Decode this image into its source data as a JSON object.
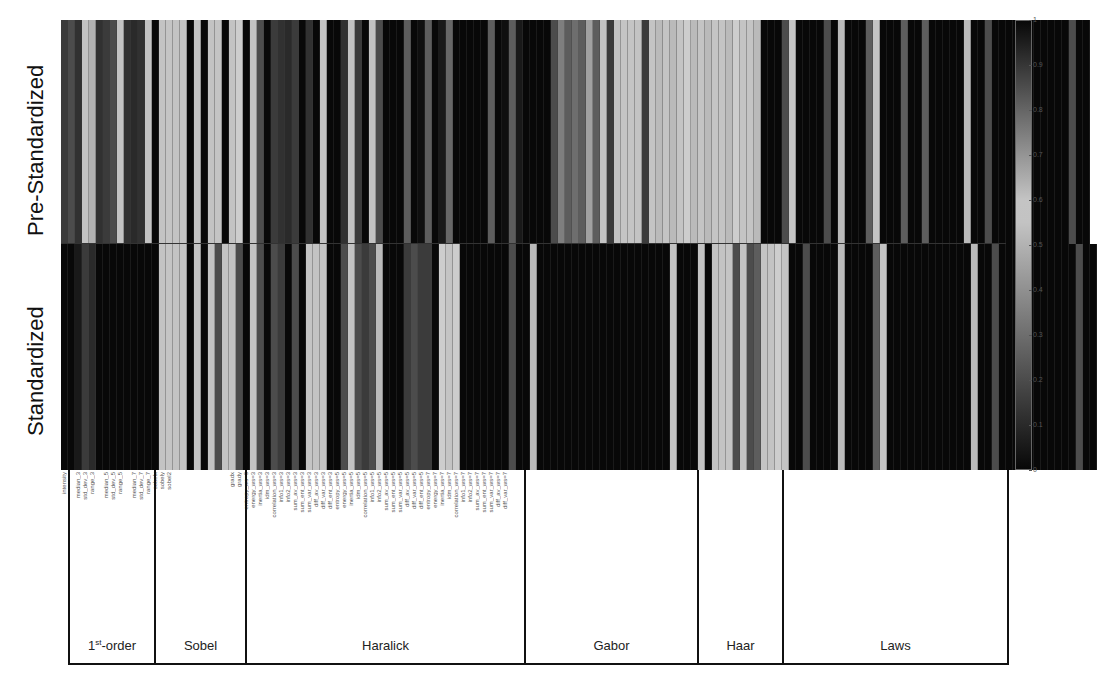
{
  "chart_data": {
    "type": "heatmap",
    "title": "",
    "ylabel_rows": [
      "Pre-Standardized",
      "Standardized"
    ],
    "colorbar": {
      "range": [
        0,
        1
      ],
      "ticks": [
        "1",
        "0.9",
        "0.8",
        "0.7",
        "0.6",
        "0.5",
        "0.4",
        "0.3",
        "0.2",
        "0.1",
        "0"
      ],
      "colormap": "gray, dark at 0 and 1, lightest around 0.55-0.6"
    },
    "groups": [
      {
        "name": "1st-order",
        "label_base": "1",
        "label_sup": "st",
        "label_rest": "-order",
        "start": 0,
        "count": 13
      },
      {
        "name": "Sobel",
        "label_base": "Sobel",
        "start": 13,
        "count": 13
      },
      {
        "name": "Haralick",
        "label_base": "Haralick",
        "start": 26,
        "count": 40
      },
      {
        "name": "Gabor",
        "label_base": "Gabor",
        "start": 66,
        "count": 25
      },
      {
        "name": "Haar",
        "label_base": "Haar",
        "start": 91,
        "count": 12
      },
      {
        "name": "Laws",
        "label_base": "Laws",
        "start": 103,
        "count": 32
      }
    ],
    "feature_labels": [
      "intensity",
      "",
      "median_3",
      "std_dev_3",
      "range_3",
      "",
      "median_5",
      "std_dev_5",
      "range_5",
      "",
      "median_7",
      "std_dev_7",
      "range_7",
      "sobelx",
      "sobely",
      "sobel2",
      "",
      "",
      "",
      "",
      "",
      "",
      "",
      "",
      "gradx",
      "grady",
      "entropy_ws=3",
      "energy_ws=3",
      "inertia_ws=3",
      "idm_ws=3",
      "correlation_ws=3",
      "info1_ws=3",
      "info2_ws=3",
      "sum_av_ws=3",
      "sum_ent_ws=3",
      "sum_var_ws=3",
      "diff_av_ws=3",
      "diff_var_ws=3",
      "diff_ent_ws=3",
      "entropy_ws=5",
      "energy_ws=5",
      "inertia_ws=5",
      "idm_ws=5",
      "correlation_ws=5",
      "info1_ws=5",
      "info2_ws=5",
      "sum_av_ws=5",
      "sum_ent_ws=5",
      "sum_var_ws=5",
      "diff_av_ws=5",
      "diff_var_ws=5",
      "diff_ent_ws=5",
      "entropy_ws=7",
      "energy_ws=7",
      "inertia_ws=7",
      "idm_ws=7",
      "correlation_ws=7",
      "info1_ws=7",
      "info2_ws=7",
      "sum_av_ws=7",
      "sum_ent_ws=7",
      "sum_var_ws=7",
      "diff_av_ws=7",
      "diff_var_ws=7",
      "",
      "",
      "",
      "",
      "",
      "",
      "",
      "",
      "",
      "",
      "",
      "",
      "",
      "",
      "",
      "",
      "",
      "",
      "",
      "",
      "",
      "",
      "",
      "",
      "",
      "",
      "",
      "",
      "",
      "",
      "",
      "",
      "",
      "",
      "",
      "",
      "",
      "",
      "",
      "",
      "",
      "",
      "",
      "",
      "",
      "",
      "",
      "",
      "",
      "",
      "",
      "",
      "",
      "",
      "",
      "",
      "",
      "",
      "",
      "",
      "",
      "",
      "",
      "",
      "",
      "",
      "",
      "",
      "",
      ""
    ],
    "rows": [
      {
        "name": "Pre-Standardized",
        "values": [
          0.15,
          0.2,
          0.12,
          0.55,
          0.5,
          0.12,
          0.15,
          0.2,
          0.55,
          0.12,
          0.1,
          0.12,
          0.55,
          0.0,
          0.55,
          0.6,
          0.55,
          0.6,
          0.0,
          0.55,
          0.0,
          0.55,
          0.6,
          0.0,
          0.55,
          0.58,
          0.0,
          0.55,
          0.2,
          0.0,
          0.15,
          0.12,
          0.1,
          0.15,
          0.0,
          0.12,
          0.0,
          0.55,
          0.0,
          0.0,
          0.12,
          0.55,
          0.15,
          0.0,
          0.55,
          0.2,
          0.0,
          0.0,
          0.0,
          0.25,
          0.0,
          0.02,
          0.25,
          0.0,
          0.05,
          0.28,
          0.0,
          0.0,
          0.0,
          0.0,
          0.0,
          0.25,
          0.0,
          0.02,
          0.25,
          0.05,
          0.0,
          0.0,
          0.0,
          0.0,
          0.2,
          0.35,
          0.25,
          0.3,
          0.25,
          0.45,
          0.25,
          0.55,
          0.15,
          0.55,
          0.6,
          0.6,
          0.55,
          0.15,
          0.6,
          0.62,
          0.6,
          0.62,
          0.6,
          0.58,
          0.62,
          0.6,
          0.62,
          0.6,
          0.6,
          0.62,
          0.58,
          0.6,
          0.6,
          0.62,
          0.0,
          0.0,
          0.0,
          0.2,
          0.6,
          0.0,
          0.0,
          0.0,
          0.0,
          0.2,
          0.0,
          0.62,
          0.0,
          0.0,
          0.0,
          0.25,
          0.6,
          0.0,
          0.0,
          0.0,
          0.25,
          0.0,
          0.0,
          0.25,
          0.0,
          0.0,
          0.0,
          0.0,
          0.0,
          0.62,
          0.0,
          0.0,
          0.2,
          0.0,
          0.0,
          0.0,
          0.0,
          0.0,
          0.0,
          0.0,
          0.0,
          0.0,
          0.0,
          0.0,
          0.2,
          0.0,
          0.0
        ]
      },
      {
        "name": "Standardized",
        "values": [
          0.0,
          0.0,
          0.05,
          0.15,
          0.1,
          0.0,
          0.0,
          0.0,
          0.0,
          0.0,
          0.0,
          0.0,
          0.0,
          0.0,
          0.55,
          0.6,
          0.55,
          0.6,
          0.0,
          0.55,
          0.0,
          0.55,
          0.2,
          0.55,
          0.55,
          0.2,
          0.0,
          0.55,
          0.2,
          0.0,
          0.2,
          0.15,
          0.0,
          0.2,
          0.0,
          0.6,
          0.55,
          0.6,
          0.0,
          0.0,
          0.2,
          0.55,
          0.2,
          0.15,
          0.2,
          0.62,
          0.0,
          0.0,
          0.0,
          0.15,
          0.2,
          0.15,
          0.15,
          0.0,
          0.58,
          0.6,
          0.58,
          0.0,
          0.0,
          0.0,
          0.0,
          0.0,
          0.0,
          0.0,
          0.2,
          0.0,
          0.0,
          0.62,
          0.0,
          0.0,
          0.0,
          0.0,
          0.0,
          0.0,
          0.0,
          0.0,
          0.0,
          0.0,
          0.0,
          0.0,
          0.0,
          0.0,
          0.0,
          0.0,
          0.0,
          0.0,
          0.0,
          0.55,
          0.0,
          0.0,
          0.0,
          0.55,
          0.0,
          0.6,
          0.55,
          0.6,
          0.2,
          0.55,
          0.2,
          0.25,
          0.6,
          0.55,
          0.58,
          0.6,
          0.0,
          0.0,
          0.2,
          0.0,
          0.0,
          0.0,
          0.0,
          0.62,
          0.0,
          0.0,
          0.0,
          0.0,
          0.25,
          0.6,
          0.0,
          0.0,
          0.0,
          0.0,
          0.0,
          0.0,
          0.0,
          0.0,
          0.0,
          0.0,
          0.0,
          0.0,
          0.62,
          0.0,
          0.0,
          0.2,
          0.0,
          0.0,
          0.0,
          0.0,
          0.0,
          0.0,
          0.0,
          0.0,
          0.0,
          0.0,
          0.0,
          0.2,
          0.0,
          0.0
        ]
      }
    ],
    "legend_position": "right",
    "grid": false
  },
  "labels": {
    "pre": "Pre-Standardized",
    "std": "Standardized"
  }
}
